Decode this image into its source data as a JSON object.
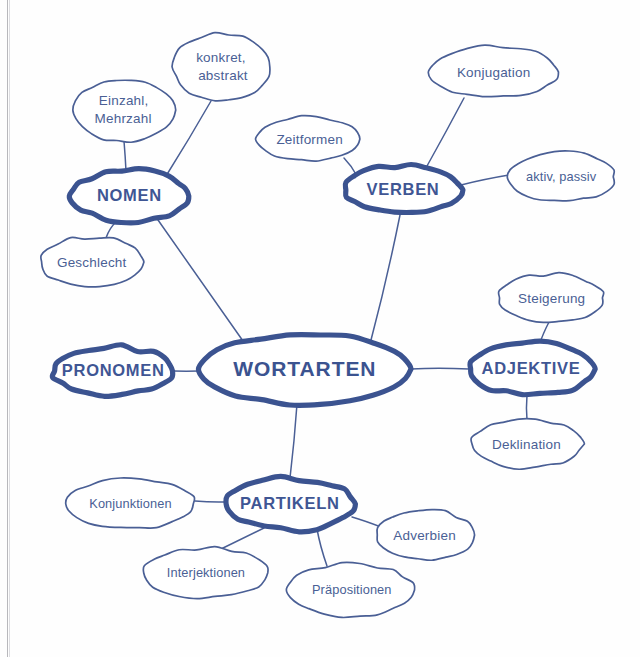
{
  "document": {
    "kind": "hand-drawn-mind-map",
    "language": "German",
    "ink_color": "#4a5f95",
    "main_node_color": "#3b5390",
    "paper_color": "#fefefe"
  },
  "center": {
    "label": "WORTARTEN",
    "cx": 305,
    "cy": 369,
    "rx": 106,
    "ry": 35
  },
  "branches": [
    {
      "id": "nomen",
      "label": "NOMEN",
      "cx": 130,
      "cy": 196,
      "rx": 60,
      "ry": 25
    },
    {
      "id": "verben",
      "label": "VERBEN",
      "cx": 403,
      "cy": 190,
      "rx": 58,
      "ry": 24
    },
    {
      "id": "adjektive",
      "label": "ADJEKTIVE",
      "cx": 531,
      "cy": 369,
      "rx": 62,
      "ry": 26
    },
    {
      "id": "partikeln",
      "label": "PARTIKELN",
      "cx": 290,
      "cy": 504,
      "rx": 64,
      "ry": 26
    },
    {
      "id": "pronomen",
      "label": "PRONOMEN",
      "cx": 113,
      "cy": 371,
      "rx": 61,
      "ry": 24
    }
  ],
  "leaves": [
    {
      "id": "einzahl-mehrzahl",
      "parent": "nomen",
      "line1": "Einzahl,",
      "line2": "Mehrzahl",
      "cx": 124,
      "cy": 110,
      "rx": 50,
      "ry": 31
    },
    {
      "id": "konkret-abstrakt",
      "parent": "nomen",
      "line1": "konkret,",
      "line2": "abstrakt",
      "cx": 222,
      "cy": 67,
      "rx": 49,
      "ry": 34
    },
    {
      "id": "geschlecht",
      "parent": "nomen",
      "line1": "Geschlecht",
      "line2": "",
      "cx": 92,
      "cy": 262,
      "rx": 52,
      "ry": 25
    },
    {
      "id": "zeitformen",
      "parent": "verben",
      "line1": "Zeitformen",
      "line2": "",
      "cx": 309,
      "cy": 139,
      "rx": 52,
      "ry": 22
    },
    {
      "id": "konjugation",
      "parent": "verben",
      "line1": "Konjugation",
      "line2": "",
      "cx": 494,
      "cy": 72,
      "rx": 64,
      "ry": 26
    },
    {
      "id": "aktiv-passiv",
      "parent": "verben",
      "line1": "aktiv, passiv",
      "line2": "",
      "cx": 562,
      "cy": 177,
      "rx": 53,
      "ry": 25
    },
    {
      "id": "steigerung",
      "parent": "adjektive",
      "line1": "Steigerung",
      "line2": "",
      "cx": 551,
      "cy": 298,
      "rx": 53,
      "ry": 24
    },
    {
      "id": "deklination",
      "parent": "adjektive",
      "line1": "Deklination",
      "line2": "",
      "cx": 527,
      "cy": 444,
      "rx": 56,
      "ry": 24
    },
    {
      "id": "konjunktionen",
      "parent": "partikeln",
      "line1": "Konjunktionen",
      "line2": "",
      "cx": 130,
      "cy": 504,
      "rx": 65,
      "ry": 25
    },
    {
      "id": "interjektionen",
      "parent": "partikeln",
      "line1": "Interjektionen",
      "line2": "",
      "cx": 206,
      "cy": 573,
      "rx": 63,
      "ry": 25
    },
    {
      "id": "praepositionen",
      "parent": "partikeln",
      "line1": "Präpositionen",
      "line2": "",
      "cx": 351,
      "cy": 590,
      "rx": 63,
      "ry": 26
    },
    {
      "id": "adverbien",
      "parent": "partikeln",
      "line1": "Adverbien",
      "line2": "",
      "cx": 425,
      "cy": 535,
      "rx": 49,
      "ry": 25
    }
  ],
  "edges": [
    {
      "id": "edge-wortarten-nomen",
      "x1": 243,
      "y1": 341,
      "x2": 158,
      "y2": 220
    },
    {
      "id": "edge-wortarten-verben",
      "x1": 371,
      "y1": 340,
      "x2": 400,
      "y2": 215
    },
    {
      "id": "edge-wortarten-adjektive",
      "x1": 411,
      "y1": 369,
      "x2": 469,
      "y2": 369
    },
    {
      "id": "edge-wortarten-partikeln",
      "x1": 297,
      "y1": 404,
      "x2": 290,
      "y2": 478
    },
    {
      "id": "edge-wortarten-pronomen",
      "x1": 199,
      "y1": 371,
      "x2": 174,
      "y2": 371
    },
    {
      "id": "edge-nomen-einzahl",
      "x1": 126,
      "y1": 171,
      "x2": 124,
      "y2": 141
    },
    {
      "id": "edge-nomen-konkret",
      "x1": 166,
      "y1": 176,
      "x2": 211,
      "y2": 101
    },
    {
      "id": "edge-nomen-geschlecht",
      "x1": 117,
      "y1": 221,
      "x2": 106,
      "y2": 238
    },
    {
      "id": "edge-verben-zeitformen",
      "x1": 357,
      "y1": 176,
      "x2": 344,
      "y2": 158
    },
    {
      "id": "edge-verben-konjugation",
      "x1": 427,
      "y1": 166,
      "x2": 464,
      "y2": 98
    },
    {
      "id": "edge-verben-aktivpassiv",
      "x1": 461,
      "y1": 185,
      "x2": 509,
      "y2": 175
    },
    {
      "id": "edge-adjektive-steigerung",
      "x1": 540,
      "y1": 343,
      "x2": 549,
      "y2": 322
    },
    {
      "id": "edge-adjektive-deklination",
      "x1": 527,
      "y1": 395,
      "x2": 527,
      "y2": 420
    },
    {
      "id": "edge-partikeln-konjunktionen",
      "x1": 226,
      "y1": 502,
      "x2": 195,
      "y2": 501
    },
    {
      "id": "edge-partikeln-interjektionen",
      "x1": 264,
      "y1": 528,
      "x2": 221,
      "y2": 549
    },
    {
      "id": "edge-partikeln-praepositionen",
      "x1": 317,
      "y1": 529,
      "x2": 327,
      "y2": 566
    },
    {
      "id": "edge-partikeln-adverbien",
      "x1": 352,
      "y1": 517,
      "x2": 381,
      "y2": 527
    }
  ]
}
